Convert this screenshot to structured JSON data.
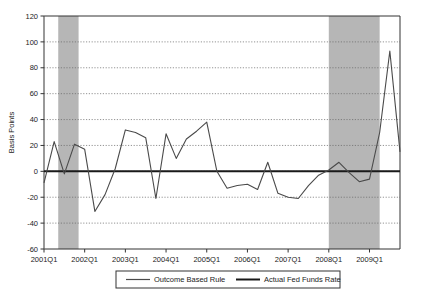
{
  "chart_data": {
    "type": "line",
    "title": "",
    "xlabel": "",
    "ylabel": "Basis Points",
    "ylim": [
      -60,
      120
    ],
    "yticks": [
      -60,
      -40,
      -20,
      0,
      20,
      40,
      60,
      80,
      100,
      120
    ],
    "ytick_labels": [
      "-60",
      "-40",
      "-20",
      "0",
      "20",
      "40",
      "60",
      "80",
      "100",
      "120"
    ],
    "xtick_labels": [
      "2001Q1",
      "2002Q1",
      "2003Q1",
      "2004Q1",
      "2005Q1",
      "2006Q1",
      "2007Q1",
      "2008Q1",
      "2009Q1"
    ],
    "xtick_quarters": [
      0,
      4,
      8,
      12,
      16,
      20,
      24,
      28,
      32
    ],
    "xlim_quarters": [
      0,
      35
    ],
    "grid": true,
    "legend_position": "bottom",
    "legend": [
      {
        "name": "Outcome Based Rule",
        "color": "#4a4a4a"
      },
      {
        "name": "Actual Fed Funds Rate",
        "color": "#1a1a1a"
      }
    ],
    "x": [
      "2001Q1",
      "2001Q2",
      "2001Q3",
      "2001Q4",
      "2002Q1",
      "2002Q2",
      "2002Q3",
      "2002Q4",
      "2003Q1",
      "2003Q2",
      "2003Q3",
      "2003Q4",
      "2004Q1",
      "2004Q2",
      "2004Q3",
      "2004Q4",
      "2005Q1",
      "2005Q2",
      "2005Q3",
      "2005Q4",
      "2006Q1",
      "2006Q2",
      "2006Q3",
      "2006Q4",
      "2007Q1",
      "2007Q2",
      "2007Q3",
      "2007Q4",
      "2008Q1",
      "2008Q2",
      "2008Q3",
      "2008Q4",
      "2009Q1",
      "2009Q2",
      "2009Q3",
      "2009Q4"
    ],
    "series": [
      {
        "name": "Outcome Based Rule",
        "color": "#4a4a4a",
        "values": [
          -9,
          23,
          -2,
          21,
          17,
          -31,
          -18,
          2,
          32,
          30,
          26,
          -21,
          29,
          10,
          25,
          31,
          38,
          0,
          -13,
          -11,
          -10,
          -14,
          7,
          -17,
          -20,
          -21,
          -11,
          -3,
          1,
          7,
          -1,
          -8,
          -6,
          30,
          93,
          15
        ]
      },
      {
        "name": "Actual Fed Funds Rate",
        "color": "#1a1a1a",
        "values": [
          0,
          0,
          0,
          0,
          0,
          0,
          0,
          0,
          0,
          0,
          0,
          0,
          0,
          0,
          0,
          0,
          0,
          0,
          0,
          0,
          0,
          0,
          0,
          0,
          0,
          0,
          0,
          0,
          0,
          0,
          0,
          0,
          0,
          0,
          0,
          0
        ]
      }
    ],
    "outcome_path_points": [
      [
        0,
        -9
      ],
      [
        1,
        23
      ],
      [
        2,
        -2
      ],
      [
        3,
        21
      ],
      [
        4,
        17
      ],
      [
        5,
        -31
      ],
      [
        6,
        -18
      ],
      [
        7,
        2
      ],
      [
        8,
        32
      ],
      [
        9,
        30
      ],
      [
        10,
        26
      ],
      [
        11,
        -21
      ],
      [
        12,
        29
      ],
      [
        13,
        10
      ],
      [
        14,
        25
      ],
      [
        15,
        31
      ],
      [
        16,
        38
      ],
      [
        17,
        0
      ],
      [
        18,
        -13
      ],
      [
        19,
        -11
      ],
      [
        20,
        -10
      ],
      [
        21,
        -14
      ],
      [
        22,
        7
      ],
      [
        23,
        -17
      ],
      [
        24,
        -20
      ],
      [
        25,
        -21
      ],
      [
        26,
        -11
      ],
      [
        27,
        -3
      ],
      [
        28,
        1
      ],
      [
        29,
        7
      ],
      [
        30,
        -1
      ],
      [
        31,
        -8
      ],
      [
        32,
        -6
      ],
      [
        33,
        30
      ],
      [
        34,
        93
      ],
      [
        35,
        15
      ]
    ],
    "annotations": {
      "peak_2008q1": 93,
      "peak_2008q4": 108,
      "trough_2002q2": -31,
      "max_value": 108,
      "min_value": -31
    },
    "shaded_regions": [
      {
        "label": "recession-band-2001",
        "start_quarter": 1.4,
        "end_quarter": 3.4,
        "color": "#a9a9a9"
      },
      {
        "label": "recession-band-2008",
        "start_quarter": 28.0,
        "end_quarter": 33.0,
        "color": "#a9a9a9"
      }
    ]
  }
}
